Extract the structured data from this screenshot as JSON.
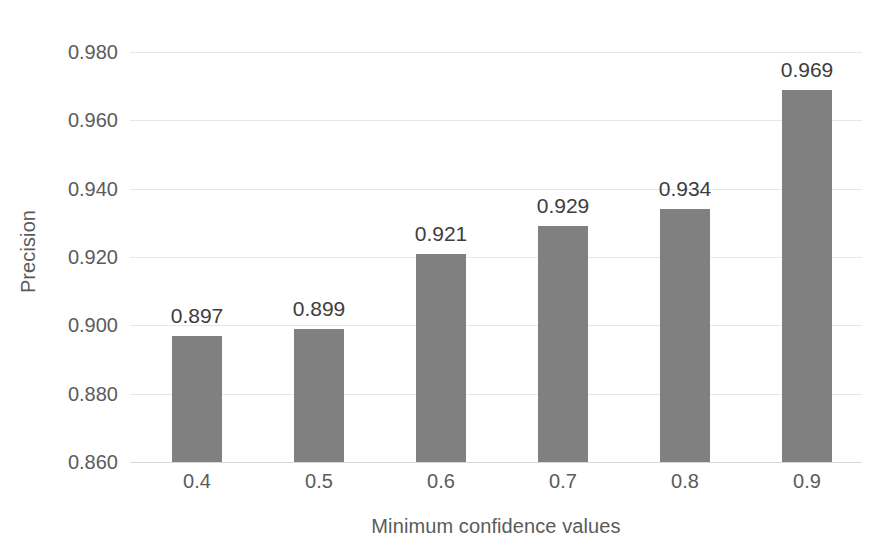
{
  "chart_data": {
    "type": "bar",
    "title": "",
    "xlabel": "Minimum confidence values",
    "ylabel": "Precision",
    "categories": [
      "0.4",
      "0.5",
      "0.6",
      "0.7",
      "0.8",
      "0.9"
    ],
    "values": [
      0.897,
      0.899,
      0.921,
      0.929,
      0.934,
      0.969
    ],
    "value_labels": [
      "0.897",
      "0.899",
      "0.921",
      "0.929",
      "0.934",
      "0.969"
    ],
    "ylim": [
      0.86,
      0.98
    ],
    "ytick_values": [
      0.98,
      0.96,
      0.94,
      0.92,
      0.9,
      0.88,
      0.86
    ],
    "ytick_labels": [
      "0.980",
      "0.960",
      "0.940",
      "0.920",
      "0.900",
      "0.880",
      "0.860"
    ],
    "grid": true,
    "legend": "none",
    "series": [
      {
        "name": "Precision",
        "values": [
          0.897,
          0.899,
          0.921,
          0.929,
          0.934,
          0.969
        ]
      }
    ],
    "colors": {
      "bar_fill": "#808080",
      "gridline": "#e6e6e6",
      "axis_line": "#d9d9d9",
      "tick_text": "#5b5b5b",
      "data_label_text": "#3d3d3d",
      "background": "#ffffff"
    }
  }
}
